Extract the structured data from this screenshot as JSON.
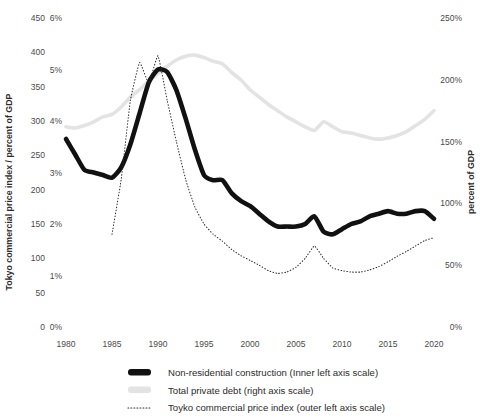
{
  "chart_data": {
    "type": "line",
    "title": "",
    "xlabel": "",
    "ylabel": "Tokyo commercial price index / percent of GDP",
    "ylabel_right": "percent of GDP",
    "x_ticks": [
      "1980",
      "1985",
      "1990",
      "1995",
      "2000",
      "2005",
      "2010",
      "2015",
      "2020"
    ],
    "x_tick_values": [
      1980,
      1985,
      1990,
      1995,
      2000,
      2005,
      2010,
      2015,
      2020
    ],
    "xlim": [
      1979,
      2021
    ],
    "axes": {
      "outer_left": {
        "name": "Tokyo commercial price index",
        "ticks": [
          "0",
          "50",
          "100",
          "150",
          "200",
          "250",
          "300",
          "350",
          "400",
          "450"
        ],
        "tick_values": [
          0,
          50,
          100,
          150,
          200,
          250,
          300,
          350,
          400,
          450
        ],
        "lim": [
          0,
          450
        ]
      },
      "inner_left": {
        "name": "Non-residential construction, percent of GDP",
        "ticks": [
          "0%",
          "1%",
          "2%",
          "3%",
          "4%",
          "5%",
          "6%"
        ],
        "tick_values": [
          0,
          1,
          2,
          3,
          4,
          5,
          6
        ],
        "lim": [
          0,
          6
        ]
      },
      "right": {
        "name": "Total private debt, percent of GDP",
        "ticks": [
          "0%",
          "50%",
          "100%",
          "150%",
          "200%",
          "250%"
        ],
        "tick_values": [
          0,
          50,
          100,
          150,
          200,
          250
        ],
        "lim": [
          0,
          250
        ]
      }
    },
    "grid": false,
    "legend_position": "bottom",
    "legend": [
      {
        "label": "Non-residential construction (Inner left axis scale)",
        "marker": "thick-solid",
        "color": "#111111"
      },
      {
        "label": "Total private debt (right axis scale)",
        "marker": "thick-solid",
        "color": "#e3e3e3"
      },
      {
        "label": "Toyko commercial price index (outer left axis scale)",
        "marker": "dotted",
        "color": "#2b2b2b"
      }
    ],
    "series": [
      {
        "name": "Non-residential construction (Inner left axis scale)",
        "axis": "inner_left",
        "unit": "percent_of_gdp",
        "color": "#111111",
        "style": "thick-solid",
        "x": [
          1980,
          1981,
          1982,
          1983,
          1984,
          1985,
          1986,
          1987,
          1988,
          1989,
          1990,
          1991,
          1992,
          1993,
          1994,
          1995,
          1996,
          1997,
          1998,
          1999,
          2000,
          2001,
          2002,
          2003,
          2004,
          2005,
          2006,
          2007,
          2008,
          2009,
          2010,
          2011,
          2012,
          2013,
          2014,
          2015,
          2016,
          2017,
          2018,
          2019,
          2020
        ],
        "values": [
          3.65,
          3.35,
          3.05,
          3.0,
          2.95,
          2.9,
          3.1,
          3.55,
          4.15,
          4.75,
          5.0,
          4.95,
          4.6,
          4.05,
          3.45,
          2.95,
          2.85,
          2.85,
          2.6,
          2.45,
          2.35,
          2.2,
          2.05,
          1.95,
          1.95,
          1.95,
          2.0,
          2.15,
          1.85,
          1.8,
          1.9,
          2.0,
          2.05,
          2.15,
          2.2,
          2.25,
          2.2,
          2.2,
          2.25,
          2.25,
          2.1
        ]
      },
      {
        "name": "Total private debt (right axis scale)",
        "axis": "right",
        "unit": "percent_of_gdp",
        "color": "#e3e3e3",
        "style": "thick-solid",
        "x": [
          1980,
          1981,
          1982,
          1983,
          1984,
          1985,
          1986,
          1987,
          1988,
          1989,
          1990,
          1991,
          1992,
          1993,
          1994,
          1995,
          1996,
          1997,
          1998,
          1999,
          2000,
          2001,
          2002,
          2003,
          2004,
          2005,
          2006,
          2007,
          2008,
          2009,
          2010,
          2011,
          2012,
          2013,
          2014,
          2015,
          2016,
          2017,
          2018,
          2019,
          2020
        ],
        "values": [
          162,
          161,
          163,
          166,
          170,
          172,
          178,
          186,
          192,
          199,
          205,
          211,
          216,
          219,
          220,
          218,
          215,
          213,
          206,
          200,
          192,
          186,
          180,
          175,
          170,
          166,
          162,
          159,
          166,
          162,
          158,
          157,
          155,
          153,
          152,
          153,
          155,
          158,
          163,
          168,
          175
        ]
      },
      {
        "name": "Toyko commercial price index (outer left axis scale)",
        "axis": "outer_left",
        "unit": "index",
        "color": "#2b2b2b",
        "style": "dotted",
        "x": [
          1985,
          1986,
          1987,
          1988,
          1989,
          1990,
          1991,
          1992,
          1993,
          1994,
          1995,
          1996,
          1997,
          1998,
          1999,
          2000,
          2001,
          2002,
          2003,
          2004,
          2005,
          2006,
          2007,
          2008,
          2009,
          2010,
          2011,
          2012,
          2013,
          2014,
          2015,
          2016,
          2017,
          2018,
          2019,
          2020
        ],
        "values": [
          135,
          215,
          330,
          385,
          355,
          395,
          330,
          270,
          215,
          175,
          150,
          135,
          125,
          113,
          104,
          97,
          90,
          82,
          78,
          80,
          87,
          100,
          118,
          100,
          86,
          82,
          80,
          80,
          83,
          88,
          95,
          103,
          110,
          118,
          126,
          130
        ]
      }
    ]
  },
  "title_ghost": ""
}
